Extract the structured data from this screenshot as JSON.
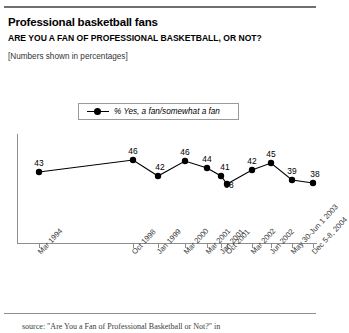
{
  "header": {
    "title": "Professional basketball fans",
    "subtitle": "ARE YOU A FAN OF PROFESSIONAL BASKETBALL, OR NOT?",
    "note": "[Numbers shown in percentages]"
  },
  "legend": {
    "label": "% Yes, a fan/somewhat a fan"
  },
  "footer": {
    "source": "source: \"Are You a Fan of Professional Basketball or Not?\" in"
  },
  "chart_data": {
    "type": "line",
    "title": "Professional basketball fans",
    "subtitle": "ARE YOU A FAN OF PROFESSIONAL BASKETBALL, OR NOT?",
    "note": "[Numbers shown in percentages]",
    "xlabel": "",
    "ylabel": "",
    "ylim": [
      30,
      50
    ],
    "grid": false,
    "legend_position": "top-center",
    "categories": [
      "Mar 1994",
      "Oct 1998",
      "Jan 1999",
      "Mar 2000",
      "Mar 2001",
      "Jan 2001",
      "Oct 2001",
      "Mar 2002",
      "Jun 2002",
      "May 30-Jun 1 2003",
      "Dec 5-8, 2004"
    ],
    "series": [
      {
        "name": "% Yes, a fan/somewhat a fan",
        "values": [
          43,
          46,
          42,
          46,
          44,
          41,
          38,
          42,
          45,
          39,
          38
        ]
      }
    ],
    "point_x": [
      39,
      133,
      158,
      185,
      207,
      221,
      227,
      252,
      271,
      292,
      313
    ],
    "point_y": [
      172,
      160,
      176,
      161,
      168,
      176,
      184,
      170,
      163,
      180,
      183
    ],
    "label_dx": [
      0,
      0,
      2,
      0,
      0,
      4,
      2,
      0,
      0,
      0,
      2
    ],
    "label_dy": [
      -9,
      -9,
      -9,
      -9,
      -9,
      -9,
      1,
      -9,
      -9,
      -9,
      -9
    ],
    "tick_x": [
      39,
      133,
      158,
      185,
      207,
      221,
      227,
      252,
      271,
      292,
      313
    ]
  }
}
